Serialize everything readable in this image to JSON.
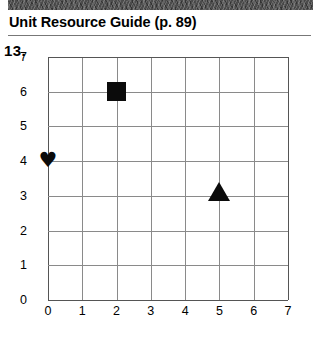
{
  "header": {
    "title": "Unit Resource Guide (p. 89)",
    "band_color": "#4a4a4a",
    "rule_color": "#777777"
  },
  "problem": {
    "number": "13."
  },
  "chart_data": {
    "type": "scatter",
    "title": "",
    "xlabel": "",
    "ylabel": "",
    "xlim": [
      0,
      7
    ],
    "ylim": [
      0,
      7
    ],
    "x_ticks": [
      "0",
      "1",
      "2",
      "3",
      "4",
      "5",
      "6",
      "7"
    ],
    "y_ticks": [
      "0",
      "1",
      "2",
      "3",
      "4",
      "5",
      "6",
      "7"
    ],
    "grid": true,
    "legend": "none",
    "grid_color": "#8a8a8a",
    "marker_color": "#0b0b0b",
    "points": [
      {
        "label": "heart",
        "marker": "heart",
        "x": 0,
        "y": 4
      },
      {
        "label": "square",
        "marker": "square",
        "x": 2,
        "y": 6
      },
      {
        "label": "triangle",
        "marker": "triangle",
        "x": 5,
        "y": 3
      }
    ],
    "heart_glyph": "♥"
  }
}
